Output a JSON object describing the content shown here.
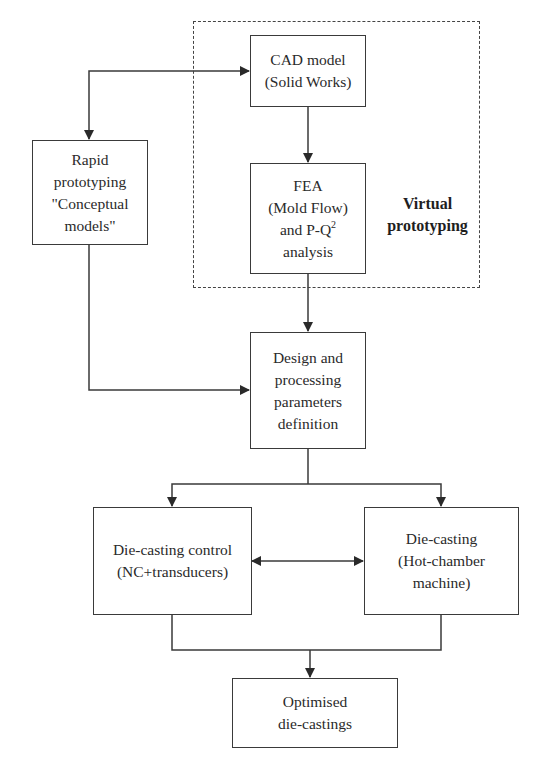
{
  "diagram": {
    "type": "flowchart",
    "group": {
      "label_line1": "Virtual",
      "label_line2": "prototyping"
    },
    "nodes": {
      "cad": {
        "line1": "CAD model",
        "line2": "(Solid Works)"
      },
      "fea": {
        "line1": "FEA",
        "line2": "(Mold Flow)",
        "line3_prefix": "and P-Q",
        "line3_sup": "2",
        "line4": "analysis"
      },
      "rapid": {
        "line1": "Rapid",
        "line2": "prototyping",
        "line3": "\"Conceptual",
        "line4": "models\""
      },
      "design": {
        "line1": "Design and",
        "line2": "processing",
        "line3": "parameters",
        "line4": "definition"
      },
      "control": {
        "line1": "Die-casting control",
        "line2": "(NC+transducers)"
      },
      "diecasting": {
        "line1": "Die-casting",
        "line2": "(Hot-chamber",
        "line3": "machine)"
      },
      "optimised": {
        "line1": "Optimised",
        "line2": "die-castings"
      }
    },
    "edges": [
      {
        "from": "rapid",
        "to": "cad",
        "bidirectional": true
      },
      {
        "from": "cad",
        "to": "fea"
      },
      {
        "from": "fea",
        "to": "design"
      },
      {
        "from": "rapid",
        "to": "design"
      },
      {
        "from": "design",
        "to": "control"
      },
      {
        "from": "design",
        "to": "diecasting"
      },
      {
        "from": "control",
        "to": "diecasting",
        "bidirectional": true
      },
      {
        "from": "control",
        "to": "optimised"
      },
      {
        "from": "diecasting",
        "to": "optimised"
      }
    ],
    "colors": {
      "line": "#3a3a3a",
      "background": "#ffffff"
    }
  }
}
